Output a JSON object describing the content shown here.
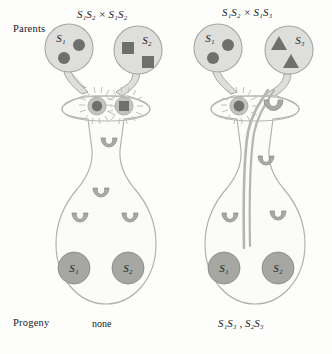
{
  "figure": {
    "type": "biology-diagram",
    "background_color": "#fdfdfc",
    "row_labels": {
      "parents": "Parents",
      "progeny": "Progeny"
    }
  },
  "palette": {
    "organ_fill": "#dededc",
    "organ_stroke": "#a6a6a2",
    "pistil_fill": "#fbfbfa",
    "pistil_stroke": "#b0b0ac",
    "pollen_dark": "#6f6f6c",
    "pollen_mid": "#8d8d89",
    "ovule_fill": "#a9a9a6",
    "ovule_stroke": "#8d8d8a",
    "seed_fill": "#a6a6a3",
    "seed_stroke": "#8a8a87",
    "tube_stroke": "#b5b5b1",
    "ray_stroke": "#b9b9b5",
    "text_color": "#20201e"
  },
  "panels": [
    {
      "id": "left",
      "cross_label": "S₁S₂ × S₁S₂",
      "cross_parts": {
        "female": "S1S2",
        "male": "S1S2"
      },
      "outcome": "incompatible",
      "progeny_label": "none",
      "anthers": [
        {
          "id": "anther-left",
          "allele_label": "S₁",
          "pollen_shape": "circle",
          "pollen_count": 2
        },
        {
          "id": "anther-right",
          "allele_label": "S₂",
          "pollen_shape": "square",
          "pollen_count": 2
        }
      ],
      "stigma_pollen": [
        {
          "shape": "circle",
          "germinating": false,
          "rays": true
        },
        {
          "shape": "square",
          "germinating": false,
          "rays": true
        }
      ],
      "pollen_tube_present": false,
      "style_ovules": 4,
      "seeds": [
        {
          "label": "S₁"
        },
        {
          "label": "S₂"
        }
      ]
    },
    {
      "id": "right",
      "cross_label": "S₁S₂ × S₁S₃",
      "cross_parts": {
        "female": "S1S2",
        "male": "S1S3"
      },
      "outcome": "partially-compatible",
      "progeny_label": "S₁S₃ , S₂S₃",
      "anthers": [
        {
          "id": "anther-left",
          "allele_label": "S₁",
          "pollen_shape": "circle",
          "pollen_count": 2
        },
        {
          "id": "anther-right",
          "allele_label": "S₃",
          "pollen_shape": "triangle",
          "pollen_count": 2
        }
      ],
      "stigma_pollen": [
        {
          "shape": "circle",
          "germinating": false,
          "rays": true
        },
        {
          "shape": "tube",
          "germinating": true,
          "rays": false
        }
      ],
      "pollen_tube_present": true,
      "style_ovules": 3,
      "seeds": [
        {
          "label": "S₁"
        },
        {
          "label": "S₂"
        }
      ]
    }
  ]
}
